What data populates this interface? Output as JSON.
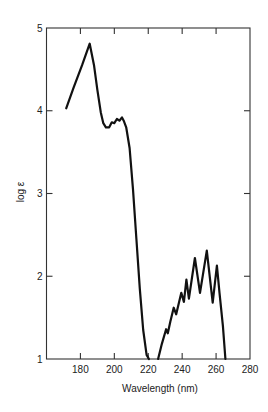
{
  "chart_data": {
    "type": "line",
    "title": "",
    "xlabel": "Wavelength (nm)",
    "ylabel": "log ε",
    "xlim": [
      160,
      280
    ],
    "ylim": [
      1,
      5
    ],
    "x_ticks": [
      180,
      200,
      220,
      240,
      260,
      280
    ],
    "y_ticks": [
      1,
      2,
      3,
      4,
      5
    ],
    "grid": false,
    "legend": null,
    "line_color": "#111111",
    "series": [
      {
        "name": "band-1",
        "x": [
          171.6,
          176,
          181,
          185.5,
          188,
          190,
          192,
          193.5,
          195,
          197,
          198.5,
          200,
          201.5,
          203,
          204.5,
          205.5,
          207,
          209,
          211,
          213,
          215,
          217,
          219,
          220.4
        ],
        "y": [
          4.03,
          4.28,
          4.55,
          4.81,
          4.55,
          4.25,
          3.98,
          3.85,
          3.8,
          3.8,
          3.86,
          3.85,
          3.9,
          3.88,
          3.92,
          3.88,
          3.8,
          3.55,
          3.05,
          2.45,
          1.85,
          1.35,
          1.05,
          1.0
        ]
      },
      {
        "name": "band-2",
        "x": [
          225.8,
          228,
          230.5,
          231.5,
          233,
          235,
          236.5,
          239.5,
          241,
          242.5,
          244,
          247.5,
          250.5,
          254.5,
          258,
          260.5,
          262,
          264,
          265.5
        ],
        "y": [
          1.0,
          1.18,
          1.36,
          1.31,
          1.45,
          1.62,
          1.54,
          1.8,
          1.69,
          1.96,
          1.73,
          2.22,
          1.8,
          2.31,
          1.68,
          2.13,
          1.8,
          1.4,
          1.0
        ]
      }
    ]
  },
  "labels": {
    "x_axis": "Wavelength (nm)",
    "y_axis": "log ε",
    "x_ticks": [
      "180",
      "200",
      "220",
      "240",
      "260",
      "280"
    ],
    "y_ticks": [
      "1",
      "2",
      "3",
      "4",
      "5"
    ]
  }
}
